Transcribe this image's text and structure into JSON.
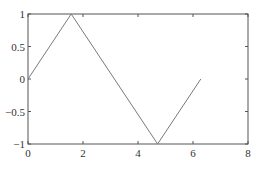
{
  "chart_data": {
    "type": "line",
    "title": "",
    "xlabel": "",
    "ylabel": "",
    "xlim": [
      0,
      8
    ],
    "ylim": [
      -1,
      1
    ],
    "grid": false,
    "legend": null,
    "x_ticks": [
      0,
      2,
      4,
      6,
      8
    ],
    "y_ticks": [
      -1,
      -0.5,
      0,
      0.5,
      1
    ],
    "x_tick_labels": [
      "0",
      "2",
      "4",
      "6",
      "8"
    ],
    "y_tick_labels": [
      "-1",
      "-0.5",
      "0",
      "0.5",
      "1"
    ],
    "series": [
      {
        "name": "triangle wave",
        "color": "#7a7a7a",
        "x": [
          0,
          1.5708,
          4.7124,
          6.2832
        ],
        "y": [
          0,
          1,
          -1,
          0
        ]
      }
    ]
  },
  "colors": {
    "axis": "#555555",
    "line": "#7a7a7a",
    "background": "#ffffff"
  }
}
